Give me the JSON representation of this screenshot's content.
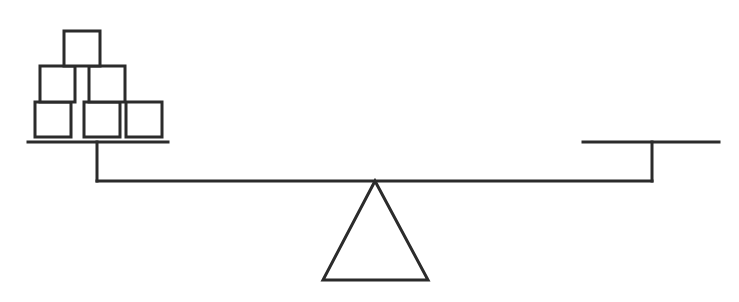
{
  "diagram": {
    "type": "balance-scale",
    "stroke_color": "#2b2b2b",
    "background": "#ffffff",
    "beam": {
      "x1": 97,
      "x2": 652,
      "y": 181
    },
    "fulcrum": {
      "apex": [
        375,
        181
      ],
      "base_left": [
        323,
        280
      ],
      "base_right": [
        428,
        280
      ]
    },
    "left_pan": {
      "platform": {
        "x1": 28,
        "x2": 168,
        "y": 142
      },
      "post": {
        "x": 97,
        "y1": 142,
        "y2": 181
      },
      "block_count": 6,
      "blocks": [
        {
          "row": 1,
          "x": 35,
          "y": 102,
          "w": 36,
          "h": 35
        },
        {
          "row": 1,
          "x": 84,
          "y": 102,
          "w": 36,
          "h": 35
        },
        {
          "row": 1,
          "x": 126,
          "y": 102,
          "w": 36,
          "h": 35
        },
        {
          "row": 2,
          "x": 40,
          "y": 66,
          "w": 35,
          "h": 36
        },
        {
          "row": 2,
          "x": 89,
          "y": 66,
          "w": 36,
          "h": 36
        },
        {
          "row": 3,
          "x": 64,
          "y": 31,
          "w": 36,
          "h": 35
        }
      ]
    },
    "right_pan": {
      "platform": {
        "x1": 583,
        "x2": 719,
        "y": 142
      },
      "post": {
        "x": 652,
        "y1": 142,
        "y2": 181
      },
      "block_count": 0,
      "blocks": []
    }
  }
}
